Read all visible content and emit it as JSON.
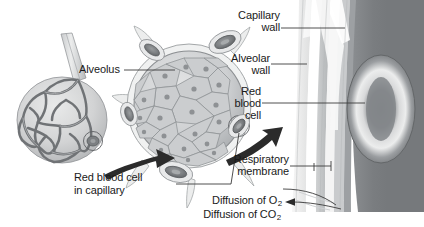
{
  "figure": {
    "background_color": "#ffffff",
    "width": 424,
    "height": 227
  },
  "labels": {
    "alveolus": "Alveolus",
    "red_blood_cell_in_capillary_line1": "Red blood cell",
    "red_blood_cell_in_capillary_line2": "in capillary",
    "capillary_wall_line1": "Capillary",
    "capillary_wall_line2": "wall",
    "alveolar_wall_line1": "Alveolar",
    "alveolar_wall_line2": "wall",
    "red_blood_cell_line1": "Red",
    "red_blood_cell_line2": "blood",
    "red_blood_cell_line3": "cell",
    "respiratory_membrane_line1": "Respiratory",
    "respiratory_membrane_line2": "membrane",
    "diffusion_of_o2_text": "Diffusion of O",
    "diffusion_of_o2_sub": "2",
    "diffusion_of_co2_text": "Diffusion of CO",
    "diffusion_of_co2_sub": "2"
  },
  "colors": {
    "text": "#1a1a1a",
    "leader_line": "#3c3c3c",
    "arrow": "#2b2b2b",
    "capillary_mesh": "#6f7275",
    "alveolus_fill": "#d9dadb",
    "alveolus_cell_fill": "#c7c9cb",
    "alveolus_cell_stroke": "#8e9194",
    "capillary_cross_section": "#8a8d90",
    "blood_dark": "#6d7073",
    "magnified_blood": "#74777a",
    "membrane_light": "#f2f2f2",
    "membrane_mid": "#bdbfc1",
    "membrane_gray": "#9ea1a4",
    "rbc_bright": "#e6e7e8"
  },
  "structures": {
    "left_alveolus_sac": "alveolar sac covered by capillary network",
    "center_alveolus": "alveolus cross-section lined with epithelial cells",
    "right_magnified": "magnified respiratory membrane with red blood cell in capillary",
    "arrow_1": "magnification arrow from alveolar sac to alveolus cross-section",
    "arrow_2": "magnification arrow from alveolus cross-section to respiratory membrane",
    "arrow_co2": "arrow indicating diffusion of carbon dioxide out of blood"
  }
}
